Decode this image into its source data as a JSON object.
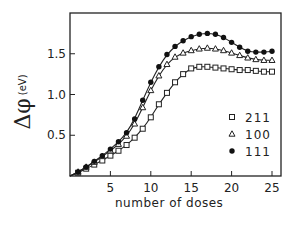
{
  "chart_data": {
    "type": "line",
    "title": "",
    "xlabel": "number of doses",
    "ylabel_symbol": "Δ φ",
    "ylabel_unit": "(eV)",
    "xlim": [
      0,
      26
    ],
    "ylim": [
      0,
      2.0
    ],
    "x_ticks": [
      5,
      10,
      15,
      20,
      25
    ],
    "y_ticks": [
      0.5,
      1.0,
      1.5
    ],
    "y_tick_labels": [
      "0.5",
      "1.0",
      "1.5"
    ],
    "x_tick_labels": [
      "5",
      "10",
      "15",
      "20",
      "25"
    ],
    "grid": false,
    "legend_position": "lower right inside",
    "x": [
      1,
      2,
      3,
      4,
      5,
      6,
      7,
      8,
      9,
      10,
      11,
      12,
      13,
      14,
      15,
      16,
      17,
      18,
      19,
      20,
      21,
      22,
      23,
      24,
      25
    ],
    "series": [
      {
        "name": "211",
        "marker": "open-square",
        "values": [
          0.04,
          0.09,
          0.14,
          0.19,
          0.25,
          0.31,
          0.38,
          0.47,
          0.58,
          0.72,
          0.88,
          1.02,
          1.15,
          1.25,
          1.32,
          1.34,
          1.34,
          1.33,
          1.32,
          1.31,
          1.3,
          1.3,
          1.29,
          1.28,
          1.28
        ]
      },
      {
        "name": "100",
        "marker": "open-triangle",
        "values": [
          0.05,
          0.11,
          0.17,
          0.24,
          0.31,
          0.39,
          0.49,
          0.64,
          0.84,
          1.05,
          1.23,
          1.37,
          1.46,
          1.51,
          1.54,
          1.56,
          1.57,
          1.56,
          1.54,
          1.51,
          1.48,
          1.45,
          1.43,
          1.42,
          1.42
        ]
      },
      {
        "name": "111",
        "marker": "filled-circle",
        "values": [
          0.05,
          0.11,
          0.18,
          0.25,
          0.33,
          0.42,
          0.53,
          0.7,
          0.93,
          1.15,
          1.34,
          1.49,
          1.59,
          1.66,
          1.71,
          1.74,
          1.75,
          1.74,
          1.7,
          1.64,
          1.58,
          1.53,
          1.52,
          1.52,
          1.53
        ]
      }
    ]
  },
  "legend": {
    "items": [
      {
        "marker": "open-square",
        "label": "211"
      },
      {
        "marker": "open-triangle",
        "label": "100"
      },
      {
        "marker": "filled-circle",
        "label": "111"
      }
    ]
  },
  "axis": {
    "xlabel": "number of doses",
    "ylabel_symbol": "Δφ",
    "ylabel_unit": "(eV)"
  }
}
